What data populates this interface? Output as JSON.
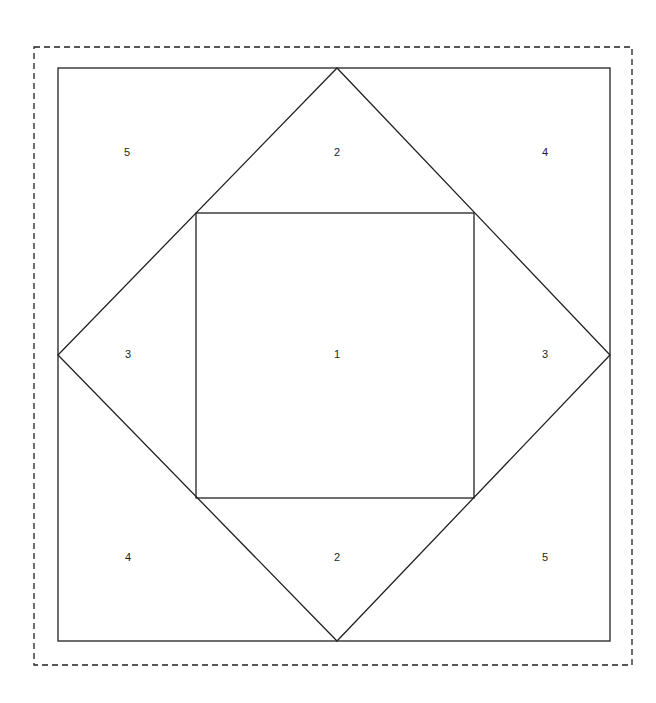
{
  "figure": {
    "canvas": {
      "width": 656,
      "height": 703,
      "background": "#ffffff"
    },
    "stroke_color": "#231f20",
    "label_color": "#231f20",
    "dashed_border": {
      "name": "dashed-bounding-box",
      "x": 34,
      "y": 47,
      "width": 598,
      "height": 618,
      "dash_pattern": "6 4",
      "stroke_width": 1.3
    },
    "outer_square": {
      "name": "outer-square",
      "x": 58,
      "y": 68,
      "width": 552,
      "height": 573,
      "stroke_width": 1.3
    },
    "diamond": {
      "name": "inscribed-diamond",
      "points": "337,68 610,355 337,641 58,355",
      "stroke_width": 1.3
    },
    "inner_square": {
      "name": "inner-square",
      "x": 196,
      "y": 213,
      "width": 278,
      "height": 285,
      "stroke_width": 1.3
    },
    "labels": [
      {
        "id": "region-5-top-left",
        "text": "5",
        "x": 127,
        "y": 153
      },
      {
        "id": "region-2-top-center",
        "text": "2",
        "x": 337,
        "y": 153
      },
      {
        "id": "region-4-top-right",
        "text": "4",
        "x": 545,
        "y": 153
      },
      {
        "id": "region-3-middle-left",
        "text": "3",
        "x": 128,
        "y": 355
      },
      {
        "id": "region-1-center",
        "text": "1",
        "x": 337,
        "y": 355
      },
      {
        "id": "region-3-middle-right",
        "text": "3",
        "x": 545,
        "y": 355
      },
      {
        "id": "region-4-bottom-left",
        "text": "4",
        "x": 128,
        "y": 558
      },
      {
        "id": "region-2-bottom-center",
        "text": "2",
        "x": 337,
        "y": 558
      },
      {
        "id": "region-5-bottom-right",
        "text": "5",
        "x": 545,
        "y": 558
      }
    ]
  }
}
